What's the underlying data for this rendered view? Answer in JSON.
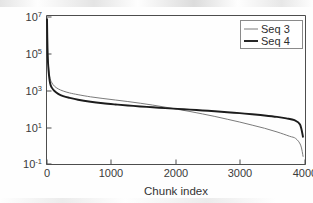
{
  "figure": {
    "background": "#ffffff",
    "axes_color": "#4d4d4d"
  },
  "chart_data": {
    "type": "line",
    "title": "",
    "subtitle": "",
    "xlabel": "Chunk index",
    "ylabel": "Chunk variance",
    "yscale": "log",
    "xscale": "linear",
    "xlim": [
      0,
      4150
    ],
    "ylim": [
      0.1,
      10000000
    ],
    "xticks": [
      0,
      1000,
      2000,
      3000,
      4000
    ],
    "xticklabels": [
      "0",
      "1000",
      "2000",
      "3000",
      "4000"
    ],
    "yticks": [
      0.1,
      10,
      1000,
      100000,
      10000000
    ],
    "yticklabels": [
      "10^-1",
      "10^1",
      "10^3",
      "10^5",
      "10^7"
    ],
    "ytick_mantissa": "10",
    "ytick_exponents": [
      "-1",
      "1",
      "3",
      "5",
      "7"
    ],
    "grid": false,
    "legend_position": "top-right",
    "series": [
      {
        "name": "Seq 3",
        "color": "#7b7b7b",
        "linewidth": 1.0,
        "x": [
          0,
          10,
          25,
          50,
          80,
          120,
          180,
          260,
          360,
          500,
          700,
          900,
          1100,
          1300,
          1500,
          1700,
          1900,
          2100,
          2300,
          2500,
          2700,
          2900,
          3100,
          3300,
          3500,
          3700,
          3900,
          4000,
          4080,
          4120
        ],
        "y": [
          7000000,
          120000,
          18000,
          4200,
          2400,
          1600,
          1150,
          880,
          700,
          560,
          430,
          350,
          290,
          240,
          195,
          155,
          120,
          92,
          70,
          52,
          38,
          27,
          19,
          13,
          8.8,
          5.6,
          3.3,
          2.5,
          1.1,
          0.26
        ]
      },
      {
        "name": "Seq 4",
        "color": "#1c1c1c",
        "linewidth": 1.9,
        "x": [
          0,
          10,
          25,
          50,
          80,
          120,
          180,
          260,
          360,
          500,
          700,
          900,
          1100,
          1300,
          1500,
          1700,
          1900,
          2100,
          2300,
          2500,
          2700,
          2900,
          3100,
          3300,
          3500,
          3700,
          3850,
          3980,
          4070,
          4120
        ],
        "y": [
          7000000,
          90000,
          11000,
          2300,
          1300,
          880,
          620,
          470,
          380,
          300,
          235,
          195,
          168,
          147,
          131,
          118,
          107,
          97,
          88,
          80,
          72,
          64,
          57,
          50,
          43,
          36,
          30,
          24,
          14,
          2.8
        ]
      }
    ],
    "legend": [
      {
        "label": "Seq 3",
        "color": "#7b7b7b",
        "linewidth": 1.0
      },
      {
        "label": "Seq 4",
        "color": "#1c1c1c",
        "linewidth": 1.9
      }
    ]
  }
}
